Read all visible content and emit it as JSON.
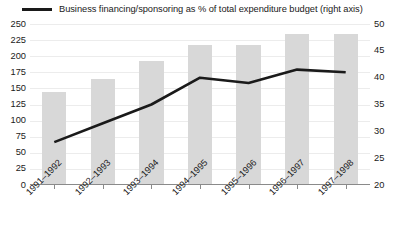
{
  "legend": {
    "series_label": "Business financing/sponsoring as % of total expenditure budget (right axis)",
    "marker": "line-swatch-icon"
  },
  "colors": {
    "bar_fill": "#d8d8d8",
    "line_stroke": "#1a1a1a",
    "gridline": "#ececec",
    "axis": "#8a8a8a",
    "background": "#ffffff"
  },
  "chart_data": {
    "type": "bar",
    "title": "",
    "subtitle": "",
    "xlabel": "",
    "ylabel": "",
    "grid": true,
    "legend_position": "top",
    "categories": [
      "1991–1992",
      "1992–1993",
      "1993–1994",
      "1994–1995",
      "1995–1996",
      "1996–1997",
      "1997–1998"
    ],
    "left_axis": {
      "name": "Total expenditure budget",
      "ylim": [
        0,
        250
      ],
      "tick_step": 25,
      "ticks": [
        0,
        25,
        50,
        75,
        100,
        125,
        150,
        175,
        200,
        225,
        250
      ],
      "tick_labels": [
        "0",
        "25",
        "50",
        "75",
        "100",
        "125",
        "150",
        "175",
        "200",
        "225",
        "250"
      ]
    },
    "right_axis": {
      "name": "Business financing/sponsoring as % of total expenditure budget",
      "ylim": [
        20,
        50
      ],
      "tick_step": 5,
      "ticks": [
        20,
        25,
        30,
        35,
        40,
        45,
        50
      ],
      "tick_labels": [
        "20",
        "25",
        "30",
        "35",
        "40",
        "45",
        "50"
      ]
    },
    "series": [
      {
        "name": "Total expenditure budget (left axis)",
        "type": "bar",
        "axis": "left",
        "values": [
          145,
          165,
          193,
          218,
          218,
          235,
          235
        ]
      },
      {
        "name": "Business financing/sponsoring as % of total expenditure budget (right axis)",
        "type": "line",
        "axis": "right",
        "values": [
          28,
          31.5,
          35,
          40,
          39,
          41.5,
          41
        ]
      }
    ]
  }
}
